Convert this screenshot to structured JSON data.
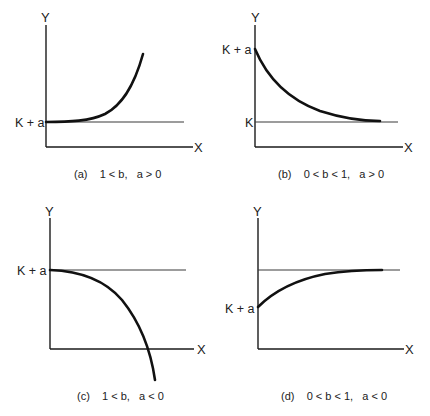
{
  "figure": {
    "panels": [
      {
        "id": "a",
        "caption": "(a)    1 < b,   a > 0",
        "y_axis_label": "Y",
        "x_axis_label": "X",
        "level_label": "K + a",
        "level_line_label": "",
        "condition": {
          "b": "1 < b",
          "a": "a > 0"
        },
        "behavior": "increasing exponential growth from K + a"
      },
      {
        "id": "b",
        "caption": "(b)    0 < b < 1,   a > 0",
        "y_axis_label": "Y",
        "x_axis_label": "X",
        "level_label": "K + a",
        "level_line_label": "K",
        "condition": {
          "b": "0 < b < 1",
          "a": "a > 0"
        },
        "behavior": "decreasing from K + a, approaching asymptote K"
      },
      {
        "id": "c",
        "caption": "(c)    1 < b,   a < 0",
        "y_axis_label": "Y",
        "x_axis_label": "X",
        "level_label": "K + a",
        "level_line_label": "",
        "condition": {
          "b": "1 < b",
          "a": "a < 0"
        },
        "behavior": "decreasing at accelerating rate from K + a, crossing X axis"
      },
      {
        "id": "d",
        "caption": "(d)    0 < b < 1,   a < 0",
        "y_axis_label": "Y",
        "x_axis_label": "X",
        "level_label": "K + a",
        "level_line_label": "",
        "condition": {
          "b": "0 < b < 1",
          "a": "a < 0"
        },
        "behavior": "increasing from K + a, approaching upper asymptote K"
      }
    ]
  },
  "style": {
    "curve_color": "#111111",
    "axis_color": "#1a1a1a",
    "background": "#ffffff"
  }
}
